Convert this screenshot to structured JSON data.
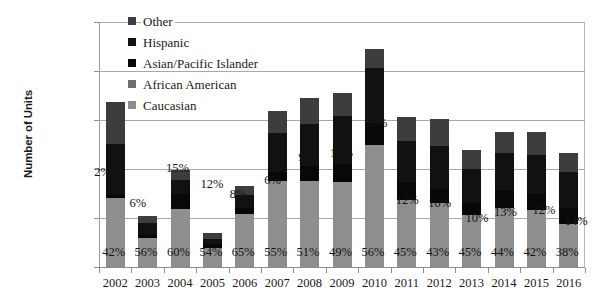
{
  "chart_data": {
    "type": "bar",
    "stacked": true,
    "title": "",
    "xlabel": "",
    "ylabel": "Number of Units",
    "ylim": [
      0,
      25000
    ],
    "ytick_step": 5000,
    "yticks": [
      "0",
      "5000",
      "10000",
      "15000",
      "20000",
      "25000"
    ],
    "grid": true,
    "legend_position": "top-left-inside",
    "categories": [
      "2002",
      "2003",
      "2004",
      "2005",
      "2006",
      "2007",
      "2008",
      "2009",
      "2010",
      "2011",
      "2012",
      "2013",
      "2014",
      "2015",
      "2016"
    ],
    "series": [
      {
        "name": "Caucasian",
        "color": "#8e8e8e",
        "values": [
          7056,
          2912,
          5940,
          1890,
          5395,
          8745,
          8772,
          8722,
          12488,
          6885,
          6493,
          5355,
          6072,
          5796,
          4408
        ]
      },
      {
        "name": "African American",
        "color": "#6f6f6f",
        "values": [
          0,
          0,
          0,
          0,
          0,
          0,
          0,
          0,
          0,
          0,
          0,
          0,
          0,
          0,
          0
        ]
      },
      {
        "name": "Asian/Pacific Islander",
        "color": "#080808",
        "values": [
          336,
          312,
          1485,
          420,
          664,
          954,
          1548,
          1780,
          2230,
          1836,
          1510,
          1190,
          1794,
          1656,
          1624
        ]
      },
      {
        "name": "Hispanic",
        "color": "#111111",
        "values": [
          5208,
          1300,
          1485,
          560,
          1245,
          3975,
          4300,
          4895,
          5575,
          4131,
          4379,
          3451,
          3726,
          4002,
          3712
        ]
      },
      {
        "name": "Other",
        "color": "#3d3d3d",
        "values": [
          4200,
          676,
          990,
          630,
          996,
          2226,
          2580,
          2403,
          2007,
          2448,
          2718,
          1904,
          2208,
          2346,
          1856
        ]
      }
    ],
    "totals": [
      16800,
      5200,
      9900,
      3500,
      8300,
      15900,
      17200,
      17800,
      22300,
      15300,
      15100,
      11900,
      13800,
      13800,
      11600
    ],
    "data_labels": {
      "caucasian_pct": [
        "42%",
        "56%",
        "60%",
        "54%",
        "65%",
        "55%",
        "51%",
        "49%",
        "56%",
        "45%",
        "43%",
        "45%",
        "44%",
        "42%",
        "38%"
      ],
      "asian_pct": [
        "2%",
        "6%",
        "15%",
        "12%",
        "8%",
        "6%",
        "9%",
        "10%",
        "10%",
        "12%",
        "10%",
        "10%",
        "13%",
        "12%",
        "14%"
      ]
    },
    "legend_entries": [
      {
        "label": "Other",
        "color": "#3d3d3d"
      },
      {
        "label": "Hispanic",
        "color": "#111111"
      },
      {
        "label": "Asian/Pacific Islander",
        "color": "#080808"
      },
      {
        "label": "African American",
        "color": "#6f6f6f"
      },
      {
        "label": "Caucasian",
        "color": "#8e8e8e"
      }
    ]
  }
}
